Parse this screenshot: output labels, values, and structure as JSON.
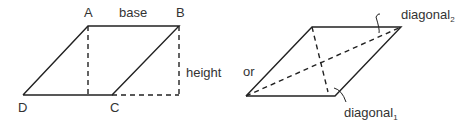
{
  "left_figure": {
    "labels": {
      "A": "A",
      "B": "B",
      "C": "C",
      "D": "D",
      "base": "base",
      "height": "height"
    }
  },
  "connector": "or",
  "right_figure": {
    "diagonal1": {
      "text": "diagonal",
      "subscript": "1"
    },
    "diagonal2": {
      "text": "diagonal",
      "subscript": "2"
    }
  },
  "colors": {
    "stroke": "#222222",
    "text": "#333333"
  }
}
